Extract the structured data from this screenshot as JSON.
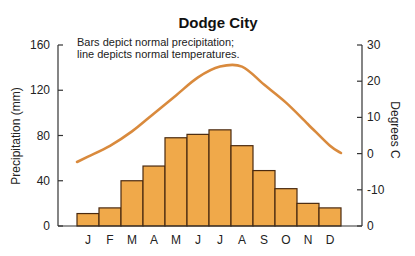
{
  "chart_data": {
    "type": "bar+line",
    "title": "Dodge City",
    "annotation": [
      "Bars depict normal precipitation;",
      "line depicts normal temperatures."
    ],
    "categories": [
      "J",
      "F",
      "M",
      "A",
      "M",
      "J",
      "J",
      "A",
      "S",
      "O",
      "N",
      "D"
    ],
    "series": [
      {
        "name": "Normal precipitation",
        "type": "bar",
        "axis": "left",
        "unit": "mm",
        "values": [
          11,
          16,
          40,
          53,
          78,
          81,
          85,
          71,
          49,
          33,
          20,
          16
        ]
      },
      {
        "name": "Normal temperature",
        "type": "line",
        "axis": "right",
        "unit": "°C",
        "values": [
          -1,
          2,
          6,
          11,
          16,
          21,
          24,
          24,
          19,
          14,
          8,
          2
        ]
      }
    ],
    "ylabel": "Precipitation (mm)",
    "ylim": [
      0,
      160
    ],
    "yticks": [
      "0",
      "40",
      "80",
      "120",
      "160"
    ],
    "y2label": "Degrees C",
    "y2lim": [
      -20,
      30
    ],
    "y2ticks": [
      "0",
      "-10",
      "0",
      "10",
      "20",
      "30"
    ],
    "xlabel": "",
    "grid": false,
    "legend": "none",
    "colors": {
      "bar_fill": "#f0a94a",
      "bar_edge": "#4a2a10",
      "line": "#d98a3d",
      "axis": "#333333"
    }
  }
}
